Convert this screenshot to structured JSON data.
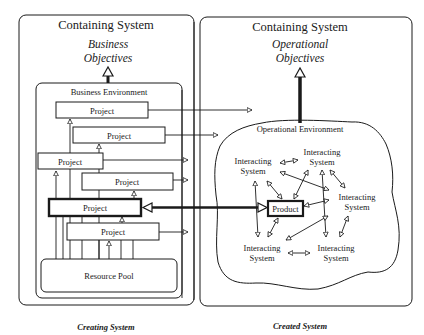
{
  "left_panel": {
    "title": "Containing System",
    "objectives_line1": "Business",
    "objectives_line2": "Objectives",
    "environment_label": "Business Environment",
    "projects": [
      {
        "label": "Project",
        "highlighted": false
      },
      {
        "label": "Project",
        "highlighted": false
      },
      {
        "label": "Project",
        "highlighted": false
      },
      {
        "label": "Project",
        "highlighted": false
      },
      {
        "label": "Project",
        "highlighted": true
      },
      {
        "label": "Project",
        "highlighted": false
      }
    ],
    "resource_pool_label": "Resource Pool",
    "caption": "Creating System"
  },
  "right_panel": {
    "title": "Containing System",
    "objectives_line1": "Operational",
    "objectives_line2": "Objectives",
    "environment_label": "Operational Environment",
    "product_label": "Product",
    "interacting_systems": [
      {
        "line1": "Interacting",
        "line2": "System"
      },
      {
        "line1": "Interacting",
        "line2": "System"
      },
      {
        "line1": "Interacting",
        "line2": "System"
      },
      {
        "line1": "Interacting",
        "line2": "System"
      },
      {
        "line1": "Interacting",
        "line2": "System"
      }
    ],
    "caption": "Created System"
  },
  "colors": {
    "line": "#1a1a1a",
    "background": "#ffffff"
  }
}
